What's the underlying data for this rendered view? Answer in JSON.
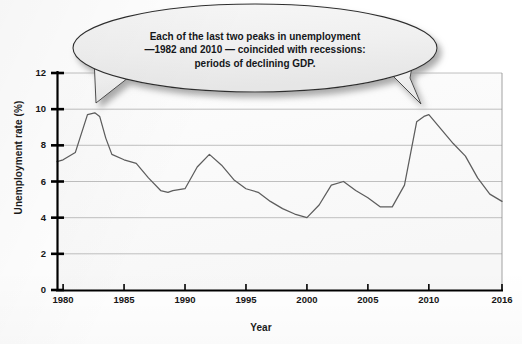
{
  "figure": {
    "background_color": "#ffffff",
    "plot_background_color": "#fbfbfb",
    "line_color": "#5d5d5d",
    "axis_color": "#000000",
    "grid_color": "#b8b8b8",
    "callout_fill": "#f1f1f1",
    "callout_stroke": "#2b2b2b",
    "callout_shadow": "#b4b4b4"
  },
  "callout": {
    "name": "speech-balloon",
    "lines": [
      "Each of the last two peaks in unemployment",
      "—1982 and 2010 — coincided with recessions:",
      "periods of declining GDP."
    ],
    "tails": [
      "1982",
      "2010"
    ]
  },
  "chart_data": {
    "type": "line",
    "title": "",
    "subtitle": "",
    "xlabel": "Year",
    "ylabel": "Unemployment rate (%)",
    "xlim": [
      1979.5,
      2016
    ],
    "ylim": [
      0,
      12
    ],
    "grid": true,
    "grid_axis": "y",
    "legend": false,
    "legend_position": "none",
    "yticks": [
      0,
      2,
      4,
      6,
      8,
      10,
      12
    ],
    "ytick_labels": [
      "0",
      "2",
      "4",
      "6",
      "8",
      "10",
      "12"
    ],
    "xticks": [
      1980,
      1985,
      1990,
      1995,
      2000,
      2005,
      2010,
      2016
    ],
    "xtick_labels": [
      "1980",
      "1985",
      "1990",
      "1995",
      "2000",
      "2005",
      "2010",
      "2016"
    ],
    "series": [
      {
        "name": "Unemployment rate",
        "color": "#5d5d5d",
        "x": [
          1979.5,
          1980,
          1981,
          1982,
          1982.6,
          1983,
          1983.5,
          1984,
          1985,
          1986,
          1987,
          1988,
          1988.6,
          1989,
          1990,
          1991,
          1992,
          1993,
          1994,
          1995,
          1996,
          1997,
          1998,
          1999,
          2000,
          2001,
          2002,
          2003,
          2004,
          2005,
          2006,
          2007,
          2008,
          2009,
          2009.6,
          2010,
          2011,
          2012,
          2013,
          2014,
          2015,
          2016
        ],
        "y": [
          7.1,
          7.2,
          7.6,
          9.7,
          9.8,
          9.6,
          8.4,
          7.5,
          7.2,
          7.0,
          6.2,
          5.5,
          5.4,
          5.5,
          5.6,
          6.8,
          7.5,
          6.9,
          6.1,
          5.6,
          5.4,
          4.9,
          4.5,
          4.2,
          4.0,
          4.7,
          5.8,
          6.0,
          5.5,
          5.1,
          4.6,
          4.6,
          5.8,
          9.3,
          9.6,
          9.7,
          8.9,
          8.1,
          7.4,
          6.2,
          5.3,
          4.9
        ]
      }
    ],
    "annotations": [
      {
        "text": "Each of the last two peaks in unemployment —1982 and 2010 — coincided with recessions: periods of declining GDP.",
        "points_to": [
          1982,
          2010
        ]
      }
    ]
  }
}
